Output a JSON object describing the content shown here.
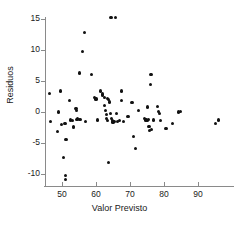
{
  "chart_data": {
    "type": "scatter",
    "title": "",
    "xlabel": "Valor Previsto",
    "ylabel": "Residuos",
    "xlim": [
      44.5,
      100
    ],
    "ylim": [
      -12.5,
      16.5
    ],
    "grid": false,
    "legend": null,
    "xticks": [
      50,
      60,
      70,
      80,
      90
    ],
    "yticks": [
      -10,
      -5,
      0,
      5,
      10,
      15
    ],
    "xtick_labels": [
      "50",
      "60",
      "70",
      "80",
      "90"
    ],
    "ytick_labels": [
      "-10",
      "-5",
      "0",
      "5",
      "10",
      "15"
    ],
    "marker": "filled-circle",
    "marker_color": "#111111",
    "points": [
      [
        46.3,
        3.0
      ],
      [
        46.6,
        -1.5
      ],
      [
        48.7,
        -3.2
      ],
      [
        49.0,
        0.0
      ],
      [
        49.6,
        3.4
      ],
      [
        49.8,
        -2.0
      ],
      [
        50.4,
        -7.3
      ],
      [
        50.9,
        -1.8
      ],
      [
        51.0,
        -10.3
      ],
      [
        51.0,
        -10.9
      ],
      [
        51.2,
        -4.4
      ],
      [
        52.2,
        1.8
      ],
      [
        52.6,
        -1.3
      ],
      [
        53.0,
        -1.4
      ],
      [
        53.3,
        -2.3
      ],
      [
        53.4,
        -2.5
      ],
      [
        54.1,
        0.6
      ],
      [
        54.3,
        0.2
      ],
      [
        54.4,
        -1.2
      ],
      [
        54.6,
        -1.1
      ],
      [
        55.2,
        6.3
      ],
      [
        55.3,
        -1.2
      ],
      [
        56.0,
        9.8
      ],
      [
        56.6,
        12.8
      ],
      [
        57.0,
        -1.5
      ],
      [
        58.6,
        6.0
      ],
      [
        59.6,
        2.4
      ],
      [
        60.0,
        2.1
      ],
      [
        60.4,
        -1.3
      ],
      [
        61.3,
        3.4
      ],
      [
        61.8,
        2.9
      ],
      [
        62.0,
        2.7
      ],
      [
        62.4,
        2.4
      ],
      [
        62.6,
        1.0
      ],
      [
        62.8,
        0.3
      ],
      [
        63.0,
        -0.4
      ],
      [
        63.2,
        -1.0
      ],
      [
        63.4,
        -1.4
      ],
      [
        63.4,
        2.2
      ],
      [
        63.6,
        2.0
      ],
      [
        63.7,
        -8.1
      ],
      [
        64.0,
        1.6
      ],
      [
        64.2,
        -0.3
      ],
      [
        64.4,
        15.3
      ],
      [
        64.6,
        -1.0
      ],
      [
        64.8,
        -1.4
      ],
      [
        65.0,
        -1.6
      ],
      [
        65.4,
        -1.5
      ],
      [
        65.8,
        15.2
      ],
      [
        66.0,
        -0.3
      ],
      [
        66.3,
        -1.5
      ],
      [
        66.8,
        -1.4
      ],
      [
        67.4,
        3.4
      ],
      [
        67.6,
        1.9
      ],
      [
        68.0,
        -1.5
      ],
      [
        69.4,
        -0.7
      ],
      [
        70.6,
        1.5
      ],
      [
        71.0,
        -4.0
      ],
      [
        71.5,
        -5.9
      ],
      [
        72.6,
        0.2
      ],
      [
        74.2,
        -1.1
      ],
      [
        74.6,
        -1.3
      ],
      [
        74.8,
        -1.2
      ],
      [
        75.0,
        -1.4
      ],
      [
        75.2,
        0.8
      ],
      [
        75.4,
        -1.2
      ],
      [
        75.6,
        -2.4
      ],
      [
        75.8,
        -3.0
      ],
      [
        76.0,
        4.4
      ],
      [
        76.2,
        6.0
      ],
      [
        76.4,
        -2.8
      ],
      [
        77.0,
        -1.3
      ],
      [
        78.2,
        0.9
      ],
      [
        78.4,
        0.1
      ],
      [
        78.6,
        -0.2
      ],
      [
        79.0,
        -1.4
      ],
      [
        80.6,
        -2.6
      ],
      [
        82.5,
        -1.8
      ],
      [
        84.2,
        0.0
      ],
      [
        84.8,
        0.1
      ],
      [
        95.2,
        -1.8
      ],
      [
        96.0,
        -1.3
      ]
    ]
  },
  "axes": {
    "x_title": "Valor Previsto",
    "y_title": "Residuos"
  }
}
